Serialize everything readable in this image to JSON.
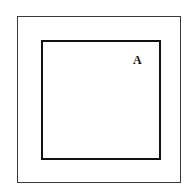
{
  "diagram": {
    "outer_square": {
      "stroke": "#3a3a3a"
    },
    "inner_square": {
      "stroke": "#111111"
    },
    "label": "A"
  }
}
